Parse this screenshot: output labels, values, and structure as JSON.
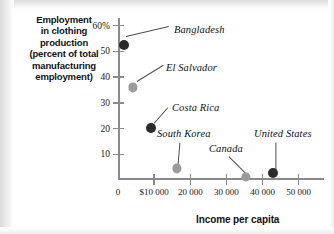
{
  "chart_data": {
    "type": "scatter",
    "title": "",
    "ylabel": "Employment in clothing production (percent of total manufacturing employment)",
    "ylabel_lines": [
      "Employment",
      "in clothing",
      "production",
      "(percent of total",
      "manufacturing",
      "employment)"
    ],
    "xlabel": "Income per capita",
    "xlim": [
      0,
      57000
    ],
    "ylim": [
      0,
      63
    ],
    "grid": false,
    "legend": "none",
    "y_ticks": [
      {
        "value": 60,
        "label": "60%"
      },
      {
        "value": 50,
        "label": "50"
      },
      {
        "value": 40,
        "label": "40"
      },
      {
        "value": 30,
        "label": "30"
      },
      {
        "value": 20,
        "label": "20"
      },
      {
        "value": 10,
        "label": "10"
      }
    ],
    "x_ticks": [
      {
        "value": 0,
        "label": "0"
      },
      {
        "value": 10000,
        "label": "$10 000"
      },
      {
        "value": 20000,
        "label": "20 000"
      },
      {
        "value": 30000,
        "label": "30 000"
      },
      {
        "value": 40000,
        "label": "40 000"
      },
      {
        "value": 50000,
        "label": "50 000"
      }
    ],
    "points": [
      {
        "name": "Bangladesh",
        "x": 1600,
        "y": 52.5,
        "color": "#2b2b2b",
        "radius": 5.0,
        "label": "Bangladesh",
        "label_x": 56,
        "label_y": 6,
        "leader_from_x": 8,
        "leader_from_y": 18,
        "leader_to_x": 51,
        "leader_to_y": 8
      },
      {
        "name": "El Salvador",
        "x": 4200,
        "y": 36.0,
        "color": "#9b9b9b",
        "radius": 4.6,
        "label": "El Salvador",
        "label_x": 48,
        "label_y": 44,
        "leader_from_x": 19,
        "leader_from_y": 63,
        "leader_to_x": 45,
        "leader_to_y": 47
      },
      {
        "name": "Costa Rica",
        "x": 9000,
        "y": 20.3,
        "color": "#2b2b2b",
        "radius": 5.0,
        "label": "Costa Rica",
        "label_x": 54,
        "label_y": 84,
        "leader_from_x": 36,
        "leader_from_y": 105,
        "leader_to_x": 50,
        "leader_to_y": 89
      },
      {
        "name": "South Korea",
        "x": 16200,
        "y": 4.5,
        "color": "#9b9b9b",
        "radius": 4.6,
        "label": "South Korea",
        "label_x": 39,
        "label_y": 110,
        "leader_from_x": 60,
        "leader_from_y": 148,
        "leader_to_x": 62,
        "leader_to_y": 124
      },
      {
        "name": "Canada",
        "x": 35500,
        "y": 1.3,
        "color": "#9b9b9b",
        "radius": 4.6,
        "label": "Canada",
        "label_x": 91,
        "label_y": 125,
        "leader_from_x": 130,
        "leader_from_y": 157,
        "leader_to_x": 111,
        "leader_to_y": 138
      },
      {
        "name": "United States",
        "x": 43000,
        "y": 2.6,
        "color": "#2b2b2b",
        "radius": 5.0,
        "label": "United States",
        "label_x": 136,
        "label_y": 110,
        "leader_from_x": 158,
        "leader_from_y": 152,
        "leader_to_x": 158,
        "leader_to_y": 124
      }
    ]
  }
}
